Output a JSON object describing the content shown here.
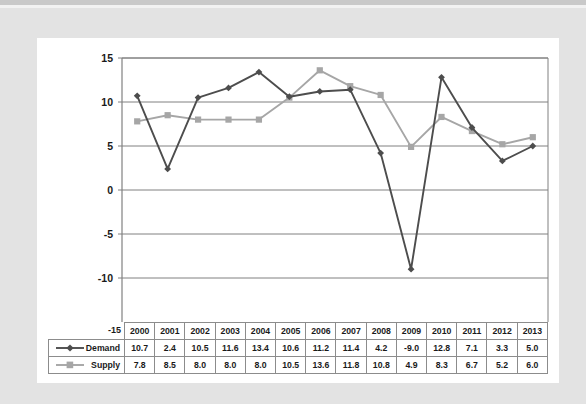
{
  "chart_data": {
    "type": "line",
    "title": "",
    "xlabel": "",
    "ylabel": "",
    "categories": [
      "2000",
      "2001",
      "2002",
      "2003",
      "2004",
      "2005",
      "2006",
      "2007",
      "2008",
      "2009",
      "2010",
      "2011",
      "2012",
      "2013"
    ],
    "series": [
      {
        "name": "Demand",
        "color": "#4d4d4d",
        "marker": "diamond",
        "values": [
          10.7,
          2.4,
          10.5,
          11.6,
          13.4,
          10.6,
          11.2,
          11.4,
          4.2,
          -9.0,
          12.8,
          7.1,
          3.3,
          5.0
        ]
      },
      {
        "name": "Supply",
        "color": "#a6a6a6",
        "marker": "square",
        "values": [
          7.8,
          8.5,
          8.0,
          8.0,
          8.0,
          10.5,
          13.6,
          11.8,
          10.8,
          4.9,
          8.3,
          6.7,
          5.2,
          6.0
        ]
      }
    ],
    "ylim": [
      -15,
      15
    ],
    "yticks": [
      15,
      10,
      5,
      0,
      -5,
      -10,
      -15
    ],
    "ytick_labels": [
      "15",
      "10",
      "5",
      "0",
      "-5",
      "-10",
      "-15"
    ],
    "grid": true,
    "legend_position": "table-left",
    "table": {
      "row_header_labels": [
        "Demand",
        "Supply"
      ],
      "column_headers": [
        "2000",
        "2001",
        "2002",
        "2003",
        "2004",
        "2005",
        "2006",
        "2007",
        "2008",
        "2009",
        "2010",
        "2011",
        "2012",
        "2013"
      ],
      "rows": [
        [
          "10.7",
          "2.4",
          "10.5",
          "11.6",
          "13.4",
          "10.6",
          "11.2",
          "11.4",
          "4.2",
          "-9.0",
          "12.8",
          "7.1",
          "3.3",
          "5.0"
        ],
        [
          "7.8",
          "8.5",
          "8.0",
          "8.0",
          "8.0",
          "10.5",
          "13.6",
          "11.8",
          "10.8",
          "4.9",
          "8.3",
          "6.7",
          "5.2",
          "6.0"
        ]
      ]
    }
  },
  "colors": {
    "demand": "#4d4d4d",
    "supply": "#a6a6a6",
    "grid": "#808080",
    "axis": "#808080",
    "card": "#ffffff",
    "frame": "#e3e3e3",
    "text": "#1a1a1a"
  }
}
